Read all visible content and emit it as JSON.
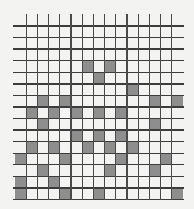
{
  "diagram": {
    "type": "grid-pattern",
    "rows": 15,
    "cols": 15,
    "colors": {
      "background": "#f3f3f1",
      "filled": "#8e8e8e",
      "line": "#3c3c3c"
    },
    "filled_cells": [
      [
        3,
        6
      ],
      [
        3,
        8
      ],
      [
        4,
        7
      ],
      [
        5,
        10
      ],
      [
        6,
        2
      ],
      [
        6,
        4
      ],
      [
        6,
        12
      ],
      [
        6,
        14
      ],
      [
        7,
        1
      ],
      [
        7,
        3
      ],
      [
        7,
        5
      ],
      [
        7,
        7
      ],
      [
        7,
        9
      ],
      [
        8,
        2
      ],
      [
        8,
        12
      ],
      [
        9,
        5
      ],
      [
        9,
        7
      ],
      [
        9,
        9
      ],
      [
        10,
        1
      ],
      [
        10,
        3
      ],
      [
        10,
        6
      ],
      [
        10,
        8
      ],
      [
        10,
        10
      ],
      [
        11,
        0
      ],
      [
        11,
        4
      ],
      [
        11,
        9
      ],
      [
        11,
        13
      ],
      [
        12,
        2
      ],
      [
        12,
        8
      ],
      [
        12,
        12
      ],
      [
        13,
        0
      ],
      [
        13,
        3
      ],
      [
        14,
        0
      ],
      [
        14,
        4
      ],
      [
        14,
        7
      ],
      [
        14,
        14
      ]
    ]
  }
}
